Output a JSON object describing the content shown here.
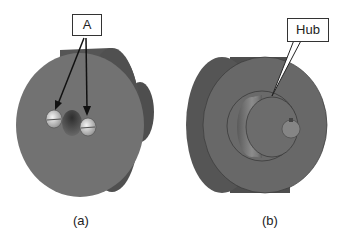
{
  "figures": [
    {
      "caption": "(a)",
      "callout": "A",
      "description": "pulley face with two set screws"
    },
    {
      "caption": "(b)",
      "callout": "Hub",
      "description": "pulley back side showing hub"
    }
  ],
  "colors": {
    "body": "#6b6b6b",
    "dark": "#4a4a4a",
    "line": "#222222"
  }
}
